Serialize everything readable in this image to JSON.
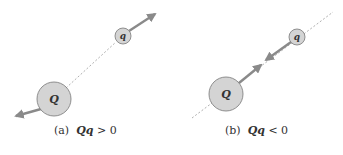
{
  "panels": [
    {
      "id": "a",
      "caption_prefix": "(a)",
      "caption_expr": "Qq",
      "caption_rel": "> 0",
      "big_charge_label": "Q",
      "small_charge_label": "q",
      "force_type": "repulsive"
    },
    {
      "id": "b",
      "caption_prefix": "(b)",
      "caption_expr": "Qq",
      "caption_rel": "< 0",
      "big_charge_label": "Q",
      "small_charge_label": "q",
      "force_type": "attractive"
    }
  ],
  "colors": {
    "charge_fill": "#d4d4d4",
    "charge_stroke": "#777777",
    "arrow": "#8a8a8a",
    "dashed_line": "#9a9a9a"
  }
}
